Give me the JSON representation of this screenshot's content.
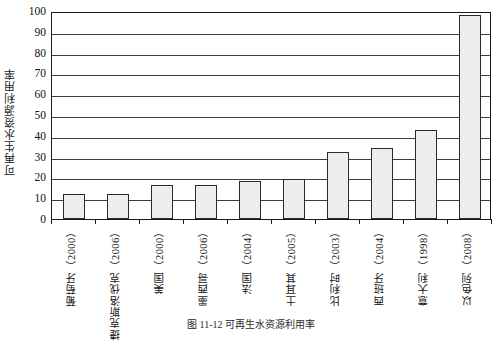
{
  "chart_data": {
    "type": "bar",
    "title": "",
    "xlabel": "",
    "ylabel": "可再生水资源利用率",
    "ylim": [
      0,
      100
    ],
    "ytick_step": 10,
    "grid": true,
    "legend": "none",
    "categories": [
      "葡萄牙（2000）",
      "捷克斯洛伐克（2006）",
      "美国（2000）",
      "墨西哥（2006）",
      "法国（2004）",
      "土耳其（2005）",
      "比利时（2003）",
      "西班牙（2004）",
      "意大利（1998）",
      "以色列（2008）"
    ],
    "values": [
      12,
      12,
      16.5,
      16.5,
      18.5,
      19,
      32,
      34,
      43,
      98
    ],
    "yticks": [
      "0",
      "10",
      "20",
      "30",
      "40",
      "50",
      "60",
      "70",
      "80",
      "90",
      "100"
    ],
    "bar_fill": "#ededed",
    "bar_edge": "#2a2a2a"
  },
  "caption": {
    "text": "图 11-12  可再生水资源利用率"
  }
}
